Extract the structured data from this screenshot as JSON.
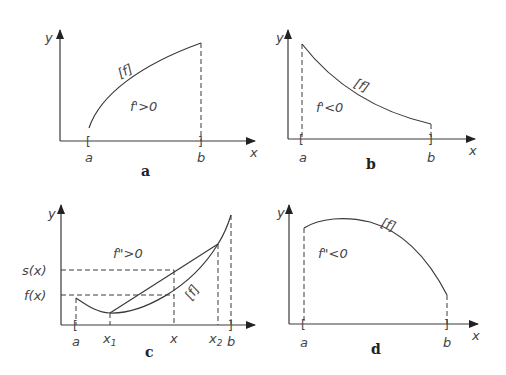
{
  "panels": {
    "a": {
      "caption": "a",
      "curve_label": "[f]",
      "condition": "f'>0",
      "x_axis": "x",
      "y_axis": "y",
      "left": "a",
      "right": "b"
    },
    "b": {
      "caption": "b",
      "curve_label": "[f]",
      "condition": "f'<0",
      "x_axis": "x",
      "y_axis": "y",
      "left": "a",
      "right": "b"
    },
    "c": {
      "caption": "c",
      "curve_label": "[f]",
      "condition": "f\">0",
      "x_axis": "x",
      "y_axis": "y",
      "left": "a",
      "right": "b",
      "x1": "x",
      "x1_sub": "1",
      "xmid": "x",
      "x2": "x",
      "x2_sub": "2",
      "s_label": "s(x)",
      "f_label": "f(x)"
    },
    "d": {
      "caption": "d",
      "curve_label": "[f]",
      "condition": "f\"<0",
      "x_axis": "x",
      "y_axis": "y",
      "left": "a",
      "right": "b"
    }
  }
}
